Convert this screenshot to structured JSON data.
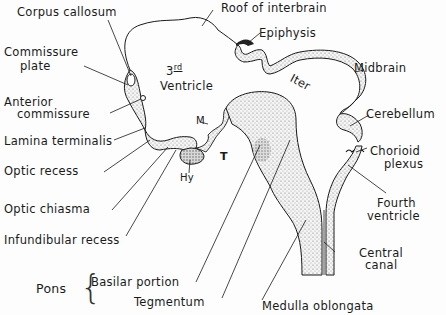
{
  "labels": {
    "corpus_callosum": "Corpus callosum",
    "commissure_plate_1": "Commissure",
    "commissure_plate_2": "plate",
    "anterior_commissure_1": "Anterior",
    "anterior_commissure_2": "commissure",
    "lamina_terminalis": "Lamina terminalis",
    "optic_recess": "Optic recess",
    "optic_chiasma": "Optic chiasma",
    "infundibular_recess": "Infundibular recess",
    "pons": "Pons",
    "basilar_portion": "Basilar portion",
    "tegmentum": "Tegmentum",
    "medulla_oblongata": "Medulla oblongata",
    "central_canal_1": "Central",
    "central_canal_2": "canal",
    "fourth_ventricle_1": "Fourth",
    "fourth_ventricle_2": "ventricle",
    "chorioid_plexus_1": "Chorioid",
    "chorioid_plexus_2": "plexus",
    "cerebellum": "Cerebellum",
    "midbrain": "Midbrain",
    "epiphysis": "Epiphysis",
    "roof_of_interbrain": "Roof of interbrain",
    "third_ventricle_num": "3",
    "third_ventricle_sup": "rd",
    "third_ventricle_word": "Ventricle",
    "iter": "Iter",
    "m": "M",
    "t": "T",
    "hy": "Hy"
  },
  "colors": {
    "ink": "#1a1a1a",
    "stipple": "#c8c8c8",
    "background": "#fdfdfd"
  }
}
